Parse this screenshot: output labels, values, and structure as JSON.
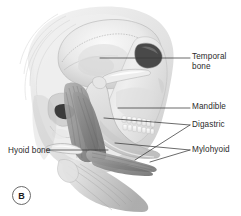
{
  "figure": {
    "panel_letter": "B",
    "caption_alt": "Lateral view of skull and mandible showing suprahyoid muscles",
    "background_color": "#ffffff",
    "line_color": "#3a3a3a",
    "text_color": "#2b2b2b"
  },
  "labels": [
    {
      "id": "temporal-bone",
      "line1": "Temporal",
      "line2": "bone",
      "side": "right",
      "x": 192,
      "y": 52
    },
    {
      "id": "mandible",
      "line1": "Mandible",
      "line2": "",
      "side": "right",
      "x": 192,
      "y": 102
    },
    {
      "id": "digastric",
      "line1": "Digastric",
      "line2": "",
      "side": "right",
      "x": 192,
      "y": 120
    },
    {
      "id": "mylohyoid",
      "line1": "Mylohyoid",
      "line2": "",
      "side": "right",
      "x": 192,
      "y": 145
    },
    {
      "id": "hyoid-bone",
      "line1": "Hyoid bone",
      "line2": "",
      "side": "left",
      "x": 8,
      "y": 146
    }
  ],
  "leader_lines": [
    {
      "id": "leader-temporal-bone",
      "from": [
        100,
        58
      ],
      "to": [
        190,
        58
      ]
    },
    {
      "id": "leader-mandible",
      "from": [
        118,
        108
      ],
      "to": [
        190,
        108
      ]
    },
    {
      "id": "leader-digastric-a",
      "from": [
        104,
        118
      ],
      "to": [
        190,
        125
      ]
    },
    {
      "id": "leader-digastric-b",
      "from": [
        135,
        160
      ],
      "to": [
        190,
        125
      ]
    },
    {
      "id": "leader-mylohyoid-a",
      "from": [
        115,
        143
      ],
      "to": [
        190,
        150
      ]
    },
    {
      "id": "leader-mylohyoid-b",
      "from": [
        150,
        162
      ],
      "to": [
        190,
        150
      ]
    },
    {
      "id": "leader-hyoid-bone",
      "from": [
        46,
        150
      ],
      "to": [
        108,
        150
      ]
    }
  ]
}
